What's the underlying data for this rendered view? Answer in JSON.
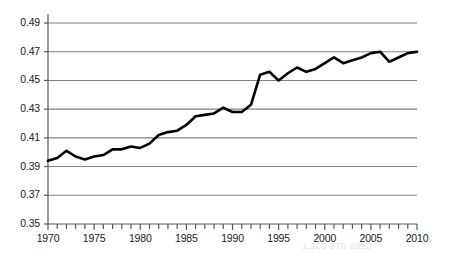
{
  "chart_data": {
    "type": "line",
    "title": "",
    "subtitle": "",
    "xlabel": "",
    "ylabel": "",
    "xlim": [
      1970,
      2010
    ],
    "ylim": [
      0.35,
      0.49
    ],
    "grid": true,
    "legend": null,
    "legend_position": "none",
    "line_color": "#000000",
    "grid_color": "#808080",
    "axis_color": "#595959",
    "yticks": [
      0.35,
      0.37,
      0.39,
      0.41,
      0.43,
      0.45,
      0.47,
      0.49
    ],
    "ytick_labels": [
      "0.35",
      "0.37",
      "0.39",
      "0.41",
      "0.43",
      "0.45",
      "0.47",
      "0.49"
    ],
    "xticks": [
      1970,
      1975,
      1980,
      1985,
      1990,
      1995,
      2000,
      2005,
      2010
    ],
    "xtick_labels": [
      "1970",
      "1975",
      "1980",
      "1985",
      "1990",
      "1995",
      "2000",
      "2005",
      "2010"
    ],
    "xtick_minor_step": 1,
    "series": [
      {
        "name": "Gini index",
        "x": [
          1970,
          1971,
          1972,
          1973,
          1974,
          1975,
          1976,
          1977,
          1978,
          1979,
          1980,
          1981,
          1982,
          1983,
          1984,
          1985,
          1986,
          1987,
          1988,
          1989,
          1990,
          1991,
          1992,
          1993,
          1994,
          1995,
          1996,
          1997,
          1998,
          1999,
          2000,
          2001,
          2002,
          2003,
          2004,
          2005,
          2006,
          2007,
          2008,
          2009,
          2010
        ],
        "values": [
          0.394,
          0.396,
          0.401,
          0.397,
          0.395,
          0.397,
          0.398,
          0.402,
          0.402,
          0.404,
          0.403,
          0.406,
          0.412,
          0.414,
          0.415,
          0.419,
          0.425,
          0.426,
          0.427,
          0.431,
          0.428,
          0.428,
          0.433,
          0.454,
          0.456,
          0.45,
          0.455,
          0.459,
          0.456,
          0.458,
          0.462,
          0.466,
          0.462,
          0.464,
          0.466,
          0.469,
          0.47,
          0.463,
          0.466,
          0.469,
          0.47
        ]
      }
    ]
  },
  "artifact": {
    "ghost_text": "1.200  870  2010"
  }
}
